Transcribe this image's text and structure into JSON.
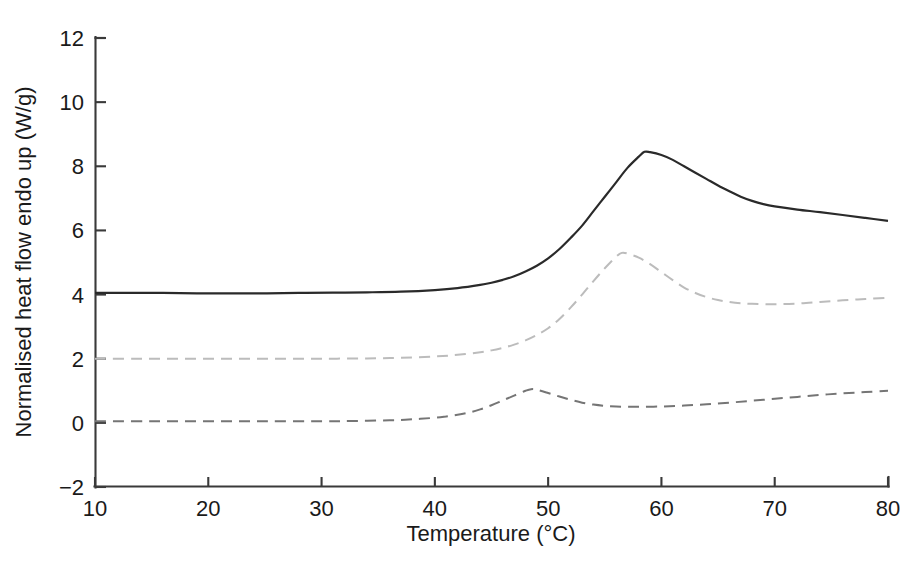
{
  "chart_data": {
    "type": "line",
    "title": "",
    "xlabel": "Temperature (°C)",
    "ylabel": "Normalised heat flow endo up (W/g)",
    "xlim": [
      10,
      80
    ],
    "ylim": [
      -2,
      12
    ],
    "xticks": [
      10,
      20,
      30,
      40,
      50,
      60,
      70,
      80
    ],
    "xtick_labels": [
      "10",
      "20",
      "30",
      "40",
      "50",
      "60",
      "70",
      "80"
    ],
    "yticks": [
      -2,
      0,
      2,
      4,
      6,
      8,
      10,
      12
    ],
    "ytick_labels": [
      "−2",
      "0",
      "2",
      "4",
      "6",
      "8",
      "10",
      "12"
    ],
    "grid": false,
    "legend": "none",
    "series": [
      {
        "name": "curve-top-solid",
        "style": "solid",
        "color": "#2a2a2a",
        "linewidth": 2.2,
        "baseline": 4.05,
        "peak_x": 58.5,
        "peak_y": 8.45,
        "end_y": 6.3,
        "x": [
          10,
          13,
          16,
          19,
          22,
          25,
          28,
          31,
          34,
          37,
          40,
          42,
          44,
          45,
          46,
          47,
          48,
          49,
          50,
          51,
          52,
          53,
          54,
          55,
          56,
          57,
          58,
          58.5,
          59,
          60,
          61,
          62,
          63,
          64,
          65,
          66,
          67,
          68,
          69,
          70,
          72,
          74,
          76,
          78,
          80
        ],
        "y": [
          4.05,
          4.05,
          4.05,
          4.04,
          4.04,
          4.04,
          4.05,
          4.06,
          4.07,
          4.09,
          4.14,
          4.2,
          4.3,
          4.37,
          4.46,
          4.57,
          4.72,
          4.9,
          5.13,
          5.42,
          5.77,
          6.15,
          6.6,
          7.05,
          7.5,
          7.95,
          8.3,
          8.45,
          8.44,
          8.35,
          8.2,
          8.0,
          7.8,
          7.6,
          7.4,
          7.22,
          7.05,
          6.92,
          6.82,
          6.75,
          6.65,
          6.57,
          6.48,
          6.39,
          6.3
        ]
      },
      {
        "name": "curve-middle-dashed",
        "style": "dashed",
        "color": "#bcbcbc",
        "linewidth": 2.0,
        "baseline": 2.0,
        "peak_x": 56.5,
        "peak_y": 5.3,
        "end_y": 3.9,
        "x": [
          10,
          14,
          18,
          22,
          26,
          30,
          34,
          37,
          40,
          42,
          44,
          45,
          46,
          47,
          48,
          49,
          50,
          51,
          52,
          53,
          54,
          55,
          56,
          56.5,
          57,
          58,
          59,
          60,
          61,
          62,
          63,
          64,
          65,
          66,
          67,
          68,
          70,
          72,
          74,
          76,
          78,
          80
        ],
        "y": [
          2.0,
          2.0,
          2.0,
          2.0,
          2.0,
          2.0,
          2.01,
          2.03,
          2.07,
          2.12,
          2.2,
          2.26,
          2.34,
          2.44,
          2.57,
          2.74,
          2.95,
          3.24,
          3.6,
          4.0,
          4.42,
          4.82,
          5.18,
          5.3,
          5.28,
          5.15,
          4.95,
          4.7,
          4.45,
          4.22,
          4.05,
          3.92,
          3.83,
          3.77,
          3.73,
          3.71,
          3.7,
          3.72,
          3.77,
          3.82,
          3.86,
          3.9
        ]
      },
      {
        "name": "curve-bottom-dashed",
        "style": "dashed",
        "color": "#757575",
        "linewidth": 2.0,
        "baseline": 0.05,
        "peak_x": 48.5,
        "peak_y": 1.05,
        "dip_y": 0.5,
        "end_y": 1.0,
        "x": [
          10,
          15,
          20,
          25,
          30,
          33,
          36,
          38,
          40,
          41,
          42,
          43,
          44,
          45,
          46,
          47,
          48,
          48.5,
          49,
          50,
          51,
          52,
          53,
          54,
          55,
          56,
          57,
          58,
          60,
          62,
          64,
          66,
          68,
          70,
          72,
          74,
          76,
          78,
          80
        ],
        "y": [
          0.05,
          0.05,
          0.05,
          0.05,
          0.05,
          0.06,
          0.08,
          0.11,
          0.16,
          0.2,
          0.25,
          0.32,
          0.42,
          0.55,
          0.7,
          0.85,
          1.0,
          1.05,
          1.03,
          0.93,
          0.82,
          0.72,
          0.63,
          0.57,
          0.53,
          0.51,
          0.5,
          0.5,
          0.51,
          0.54,
          0.58,
          0.63,
          0.69,
          0.75,
          0.81,
          0.87,
          0.92,
          0.96,
          1.0
        ]
      }
    ]
  },
  "axes": {
    "x_title": "Temperature (°C)",
    "y_title": "Normalised heat flow endo up (W/g)"
  }
}
